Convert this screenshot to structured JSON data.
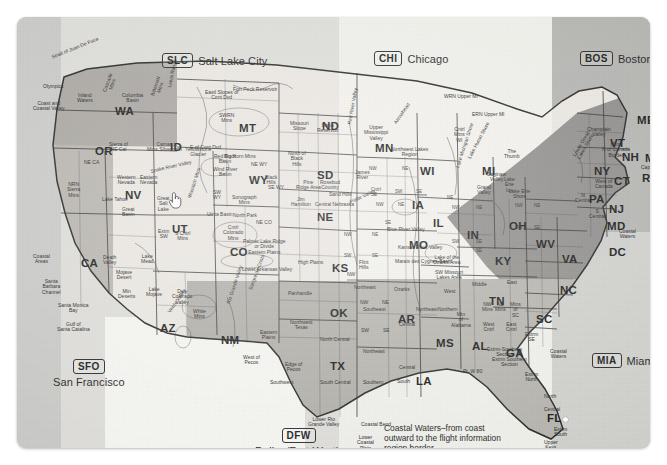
{
  "document": {
    "title": "United States Flight Information Region Map",
    "media": "scanned-paper-map"
  },
  "fir_callouts": [
    {
      "code": "SLC",
      "name": "Salt Lake City",
      "layout": "inline"
    },
    {
      "code": "CHI",
      "name": "Chicago",
      "layout": "inline"
    },
    {
      "code": "BOS",
      "name": "Boston",
      "layout": "inline"
    },
    {
      "code": "SFO",
      "name": "San Francisco",
      "layout": "stacked"
    },
    {
      "code": "DFW",
      "name": "Dallas/Fort Worth",
      "layout": "stacked"
    },
    {
      "code": "MIA",
      "name": "Miami",
      "layout": "inline"
    }
  ],
  "caption": {
    "coastal_waters": "Coastal Waters–from coast outward to the flight information region border"
  },
  "states": [
    {
      "abbr": "WA",
      "x": 98,
      "y": 88
    },
    {
      "abbr": "OR",
      "x": 78,
      "y": 128
    },
    {
      "abbr": "CA",
      "x": 64,
      "y": 240
    },
    {
      "abbr": "NV",
      "x": 108,
      "y": 172
    },
    {
      "abbr": "ID",
      "x": 153,
      "y": 124
    },
    {
      "abbr": "MT",
      "x": 222,
      "y": 105
    },
    {
      "abbr": "WY",
      "x": 232,
      "y": 157
    },
    {
      "abbr": "UT",
      "x": 155,
      "y": 206
    },
    {
      "abbr": "CO",
      "x": 213,
      "y": 229
    },
    {
      "abbr": "AZ",
      "x": 143,
      "y": 305
    },
    {
      "abbr": "NM",
      "x": 204,
      "y": 317
    },
    {
      "abbr": "ND",
      "x": 305,
      "y": 103
    },
    {
      "abbr": "SD",
      "x": 300,
      "y": 152
    },
    {
      "abbr": "NE",
      "x": 300,
      "y": 194
    },
    {
      "abbr": "KS",
      "x": 315,
      "y": 245
    },
    {
      "abbr": "OK",
      "x": 313,
      "y": 290
    },
    {
      "abbr": "TX",
      "x": 313,
      "y": 343
    },
    {
      "abbr": "MN",
      "x": 358,
      "y": 125
    },
    {
      "abbr": "IA",
      "x": 395,
      "y": 182
    },
    {
      "abbr": "MO",
      "x": 392,
      "y": 222
    },
    {
      "abbr": "AR",
      "x": 381,
      "y": 296
    },
    {
      "abbr": "LA",
      "x": 399,
      "y": 358
    },
    {
      "abbr": "WI",
      "x": 403,
      "y": 148
    },
    {
      "abbr": "IL",
      "x": 416,
      "y": 200
    },
    {
      "abbr": "MS",
      "x": 419,
      "y": 320
    },
    {
      "abbr": "MI",
      "x": 465,
      "y": 148
    },
    {
      "abbr": "IN",
      "x": 450,
      "y": 212
    },
    {
      "abbr": "OH",
      "x": 492,
      "y": 203
    },
    {
      "abbr": "KY",
      "x": 478,
      "y": 238
    },
    {
      "abbr": "TN",
      "x": 472,
      "y": 278
    },
    {
      "abbr": "AL",
      "x": 455,
      "y": 323
    },
    {
      "abbr": "GA",
      "x": 489,
      "y": 330
    },
    {
      "abbr": "FL",
      "x": 530,
      "y": 395
    },
    {
      "abbr": "SC",
      "x": 519,
      "y": 296
    },
    {
      "abbr": "NC",
      "x": 543,
      "y": 267
    },
    {
      "abbr": "VA",
      "x": 545,
      "y": 236
    },
    {
      "abbr": "WV",
      "x": 519,
      "y": 221
    },
    {
      "abbr": "PA",
      "x": 572,
      "y": 176
    },
    {
      "abbr": "NY",
      "x": 577,
      "y": 148
    },
    {
      "abbr": "VT",
      "x": 593,
      "y": 120
    },
    {
      "abbr": "NH",
      "x": 605,
      "y": 134
    },
    {
      "abbr": "ME",
      "x": 620,
      "y": 97
    },
    {
      "abbr": "MA",
      "x": 628,
      "y": 135
    },
    {
      "abbr": "CT",
      "x": 597,
      "y": 158
    },
    {
      "abbr": "RI",
      "x": 625,
      "y": 155
    },
    {
      "abbr": "NJ",
      "x": 592,
      "y": 186
    },
    {
      "abbr": "MD",
      "x": 590,
      "y": 203
    },
    {
      "abbr": "DC",
      "x": 592,
      "y": 229
    }
  ],
  "named_regions": [
    {
      "text": "Strait of Juan De Fuca",
      "x": 34,
      "y": 38,
      "rot": -22
    },
    {
      "text": "Olympics",
      "x": 26,
      "y": 67,
      "rot": 0
    },
    {
      "text": "Coast and\nCoastal Valley",
      "x": 16,
      "y": 84,
      "rot": 0
    },
    {
      "text": "Inland\nWaters",
      "x": 60,
      "y": 76,
      "rot": 0
    },
    {
      "text": "Cascade\nMtns",
      "x": 85,
      "y": 74,
      "rot": -70
    },
    {
      "text": "Columbia\nBasin",
      "x": 105,
      "y": 76,
      "rot": 0
    },
    {
      "text": "Bitterroot\nMtns",
      "x": 133,
      "y": 78,
      "rot": -72
    },
    {
      "text": "Lewis Range",
      "x": 150,
      "y": 70,
      "rot": -78
    },
    {
      "text": "E of Cont Dvd",
      "x": 173,
      "y": 128,
      "rot": 0
    },
    {
      "text": "Eastl Slopes of\nCont Dvd",
      "x": 188,
      "y": 73,
      "rot": 0
    },
    {
      "text": "Fort Peck Reservoir",
      "x": 216,
      "y": 70,
      "rot": 0
    },
    {
      "text": "SWRN\nMtns",
      "x": 202,
      "y": 96,
      "rot": 0
    },
    {
      "text": "Sierra of\nNE Cal",
      "x": 92,
      "y": 125,
      "rot": 0
    },
    {
      "text": "Snake River Valley",
      "x": 133,
      "y": 152,
      "rot": -13
    },
    {
      "text": "Camas\nMtns Silverhorn",
      "x": 130,
      "y": 125,
      "rot": 0
    },
    {
      "text": "Yellowstone\nGlacier",
      "x": 168,
      "y": 130,
      "rot": 0
    },
    {
      "text": "Big Horn Mtns",
      "x": 207,
      "y": 137,
      "rot": 0
    },
    {
      "text": "Wind River\nBasin",
      "x": 196,
      "y": 150,
      "rot": 0
    },
    {
      "text": "Red Rock\nBasin",
      "x": 197,
      "y": 137,
      "rot": 0
    },
    {
      "text": "Black\nHills",
      "x": 248,
      "y": 158,
      "rot": 0
    },
    {
      "text": "NE WY",
      "x": 234,
      "y": 145,
      "rot": 0
    },
    {
      "text": "SE WY",
      "x": 251,
      "y": 168,
      "rot": 0
    },
    {
      "text": "SW\nWY",
      "x": 196,
      "y": 173,
      "rot": 0
    },
    {
      "text": "Sonograph\nMtns",
      "x": 215,
      "y": 178,
      "rot": 0
    },
    {
      "text": "Great\nSalt\nLake",
      "x": 140,
      "y": 179,
      "rot": 0
    },
    {
      "text": "Wasatch Mtns",
      "x": 170,
      "y": 180,
      "rot": -72
    },
    {
      "text": "Uinta Basin",
      "x": 190,
      "y": 195,
      "rot": 0
    },
    {
      "text": "North Park",
      "x": 216,
      "y": 196,
      "rot": 0
    },
    {
      "text": "Western\nNevada",
      "x": 100,
      "y": 158,
      "rot": 0
    },
    {
      "text": "Eastern\nNevada",
      "x": 123,
      "y": 158,
      "rot": 0
    },
    {
      "text": "Lake Tahoe",
      "x": 85,
      "y": 180,
      "rot": 0
    },
    {
      "text": "Great\nBasin",
      "x": 105,
      "y": 190,
      "rot": 0
    },
    {
      "text": "NRN\nSierra\nMtns",
      "x": 50,
      "y": 165,
      "rot": 0
    },
    {
      "text": "NE CA",
      "x": 67,
      "y": 143,
      "rot": 0
    },
    {
      "text": "Extm\nSW",
      "x": 141,
      "y": 212,
      "rot": 0
    },
    {
      "text": "S Cntrl\nMtns",
      "x": 158,
      "y": 214,
      "rot": 0
    },
    {
      "text": "Cntrl\nColorado\nMtns",
      "x": 206,
      "y": 208,
      "rot": 0
    },
    {
      "text": "NE CO",
      "x": 239,
      "y": 203,
      "rot": 0
    },
    {
      "text": "Palmer Lake Ridge\nor Divide\nEastern Plains",
      "x": 226,
      "y": 222,
      "rot": 0
    },
    {
      "text": "Lower Arkansas Valley",
      "x": 225,
      "y": 250,
      "rot": 0
    },
    {
      "text": "High Plains",
      "x": 281,
      "y": 243,
      "rot": 0
    },
    {
      "text": "Coastal\nAreas",
      "x": 16,
      "y": 237,
      "rot": 0
    },
    {
      "text": "Santa\nBarbara\nChannel",
      "x": 25,
      "y": 262,
      "rot": 0
    },
    {
      "text": "Santa Monica\nBay",
      "x": 41,
      "y": 286,
      "rot": 0
    },
    {
      "text": "Gulf of\nSanta Catalina",
      "x": 40,
      "y": 305,
      "rot": 0
    },
    {
      "text": "Death\nValley",
      "x": 86,
      "y": 238,
      "rot": 0
    },
    {
      "text": "Mojave\nDesert",
      "x": 99,
      "y": 253,
      "rot": 0
    },
    {
      "text": "Mtn\nDeserts",
      "x": 101,
      "y": 272,
      "rot": 0
    },
    {
      "text": "Lake\nMead",
      "x": 124,
      "y": 237,
      "rot": 0
    },
    {
      "text": "Lake\nMojave",
      "x": 129,
      "y": 270,
      "rot": 0
    },
    {
      "text": "Dely\nColorado\nValley",
      "x": 155,
      "y": 272,
      "rot": 0
    },
    {
      "text": "White\nMtns",
      "x": 176,
      "y": 292,
      "rot": 0
    },
    {
      "text": "Verde Valley",
      "x": 150,
      "y": 294,
      "rot": -55
    },
    {
      "text": "Rio Grande Valley",
      "x": 209,
      "y": 286,
      "rot": -72
    },
    {
      "text": "Sangre de Cristo",
      "x": 231,
      "y": 272,
      "rot": -70
    },
    {
      "text": "Eastern\nPlains",
      "x": 243,
      "y": 313,
      "rot": 0
    },
    {
      "text": "West of\nPecos",
      "x": 226,
      "y": 338,
      "rot": 0
    },
    {
      "text": "Edge of\nPecos",
      "x": 268,
      "y": 345,
      "rot": 0
    },
    {
      "text": "Panhandle",
      "x": 271,
      "y": 274,
      "rot": 0
    },
    {
      "text": "Northwest\nTexas",
      "x": 273,
      "y": 303,
      "rot": 0
    },
    {
      "text": "North Central",
      "x": 303,
      "y": 320,
      "rot": 0
    },
    {
      "text": "South Central",
      "x": 303,
      "y": 363,
      "rot": 0
    },
    {
      "text": "Southwest",
      "x": 253,
      "y": 363,
      "rot": 0
    },
    {
      "text": "Lower Rio\nGrande Valley",
      "x": 291,
      "y": 400,
      "rot": 0
    },
    {
      "text": "Coastal Bend",
      "x": 344,
      "y": 405,
      "rot": 0
    },
    {
      "text": "Lower\nCoastal\nPlain",
      "x": 340,
      "y": 418,
      "rot": 0
    },
    {
      "text": "Missouri\nSlope",
      "x": 273,
      "y": 104,
      "rot": 0
    },
    {
      "text": "Dana\nReservoir",
      "x": 300,
      "y": 106,
      "rot": 0
    },
    {
      "text": "North of\nBlack\nHills",
      "x": 271,
      "y": 134,
      "rot": 0
    },
    {
      "text": "Red River Valley",
      "x": 330,
      "y": 107,
      "rot": -80
    },
    {
      "text": "James\nRiver",
      "x": 338,
      "y": 153,
      "rot": 0
    },
    {
      "text": "Pine\nRidge Area",
      "x": 279,
      "y": 163,
      "rot": 0
    },
    {
      "text": "Rosebud\nCountry",
      "x": 303,
      "y": 163,
      "rot": 0
    },
    {
      "text": "Sand Hills",
      "x": 312,
      "y": 175,
      "rot": 0
    },
    {
      "text": "Jim\nHamilton",
      "x": 274,
      "y": 180,
      "rot": 0
    },
    {
      "text": "Central Nebraska",
      "x": 298,
      "y": 185,
      "rot": 0
    },
    {
      "text": "Platte Valley",
      "x": 332,
      "y": 183,
      "rot": -25
    },
    {
      "text": "Upper\nMississippi\nValley",
      "x": 347,
      "y": 108,
      "rot": 0
    },
    {
      "text": "Arrowhead",
      "x": 376,
      "y": 105,
      "rot": -55
    },
    {
      "text": "Northwest Lakes\nRegion",
      "x": 374,
      "y": 130,
      "rot": 0
    },
    {
      "text": "WRN Upper MI",
      "x": 427,
      "y": 77,
      "rot": 0
    },
    {
      "text": "ERN Upper MI",
      "x": 455,
      "y": 95,
      "rot": 0
    },
    {
      "text": "Cntrl\nMtns\nWI",
      "x": 437,
      "y": 110,
      "rot": 0
    },
    {
      "text": "Lake Huron Shore",
      "x": 450,
      "y": 140,
      "rot": -62
    },
    {
      "text": "The\nThumb",
      "x": 487,
      "y": 132,
      "rot": 0
    },
    {
      "text": "Lake Michigan Shore",
      "x": 438,
      "y": 150,
      "rot": -72
    },
    {
      "text": "Saginaw\nValley",
      "x": 470,
      "y": 155,
      "rot": 0
    },
    {
      "text": "Grand\nValley",
      "x": 460,
      "y": 168,
      "rot": 0
    },
    {
      "text": "Lake Erie\nShore",
      "x": 492,
      "y": 172,
      "rot": 0
    },
    {
      "text": "Lake\nErie\nIce",
      "x": 487,
      "y": 160,
      "rot": 0
    },
    {
      "text": "Lower Great\nLakes Shore",
      "x": 555,
      "y": 138,
      "rot": -60
    },
    {
      "text": "Champlain\nValley",
      "x": 570,
      "y": 110,
      "rot": 0
    },
    {
      "text": "Mtns\nN of Canada\nBorder",
      "x": 585,
      "y": 125,
      "rot": 0
    },
    {
      "text": "West of\nCanada",
      "x": 578,
      "y": 162,
      "rot": 0
    },
    {
      "text": "N\nCentral",
      "x": 558,
      "y": 176,
      "rot": 0
    },
    {
      "text": "S\nCentral",
      "x": 572,
      "y": 192,
      "rot": 0
    },
    {
      "text": "Cape Cod",
      "x": 624,
      "y": 148,
      "rot": 0
    },
    {
      "text": "Coastal\nWaters",
      "x": 602,
      "y": 212,
      "rot": 0
    },
    {
      "text": "Blue River Valley",
      "x": 370,
      "y": 210,
      "rot": 0
    },
    {
      "text": "Kansas River Valley",
      "x": 381,
      "y": 228,
      "rot": 0
    },
    {
      "text": "Marais des Cygnes Basin",
      "x": 378,
      "y": 242,
      "rot": 0
    },
    {
      "text": "Lake of the\nOzarks Area",
      "x": 416,
      "y": 238,
      "rot": 0
    },
    {
      "text": "SW Missouri\nLakes Area",
      "x": 418,
      "y": 253,
      "rot": 0
    },
    {
      "text": "Flint\nHills",
      "x": 342,
      "y": 243,
      "rot": 0
    },
    {
      "text": "Ozarks",
      "x": 377,
      "y": 270,
      "rot": 0
    },
    {
      "text": "Northeast",
      "x": 337,
      "y": 268,
      "rot": 0
    },
    {
      "text": "Northeast",
      "x": 399,
      "y": 290,
      "rot": 0
    },
    {
      "text": "Southeast",
      "x": 346,
      "y": 290,
      "rot": 0
    },
    {
      "text": "Northeast",
      "x": 346,
      "y": 332,
      "rot": 0
    },
    {
      "text": "Central",
      "x": 382,
      "y": 305,
      "rot": 0
    },
    {
      "text": "Central",
      "x": 382,
      "y": 348,
      "rot": 0
    },
    {
      "text": "South",
      "x": 380,
      "y": 362,
      "rot": 0
    },
    {
      "text": "Southern",
      "x": 346,
      "y": 363,
      "rot": 0
    },
    {
      "text": "Northern",
      "x": 421,
      "y": 290,
      "rot": 0
    },
    {
      "text": "Middle",
      "x": 455,
      "y": 265,
      "rot": 0
    },
    {
      "text": "East",
      "x": 490,
      "y": 263,
      "rot": 0
    },
    {
      "text": "West",
      "x": 427,
      "y": 272,
      "rot": 0
    },
    {
      "text": "Pt. W 80",
      "x": 446,
      "y": 352,
      "rot": 0
    },
    {
      "text": "Extrm Southern\nSection",
      "x": 475,
      "y": 340,
      "rot": 0
    },
    {
      "text": "Extrm\nNorth",
      "x": 508,
      "y": 355,
      "rot": 0
    },
    {
      "text": "North",
      "x": 527,
      "y": 377,
      "rot": 0
    },
    {
      "text": "Central",
      "x": 527,
      "y": 390,
      "rot": 0
    },
    {
      "text": "Extrm\nSouth",
      "x": 537,
      "y": 410,
      "rot": 0
    },
    {
      "text": "Upper\nKeys",
      "x": 527,
      "y": 423,
      "rot": 0
    },
    {
      "text": "Lower Keys",
      "x": 497,
      "y": 437,
      "rot": 0
    },
    {
      "text": "Florida Straits",
      "x": 541,
      "y": 437,
      "rot": 0
    },
    {
      "text": "Coastal\nWaters",
      "x": 533,
      "y": 332,
      "rot": 0
    },
    {
      "text": "Extrm-Southern\nSection",
      "x": 470,
      "y": 330,
      "rot": 0
    },
    {
      "text": "Mtns\nof\nSC",
      "x": 493,
      "y": 285,
      "rot": 0
    },
    {
      "text": "NW\nMtns",
      "x": 465,
      "y": 285,
      "rot": 0
    },
    {
      "text": "NE\nMtns",
      "x": 478,
      "y": 285,
      "rot": 0
    },
    {
      "text": "West\nCntrl",
      "x": 466,
      "y": 305,
      "rot": 0
    },
    {
      "text": "East\nCntrl",
      "x": 489,
      "y": 305,
      "rot": 0
    },
    {
      "text": "Extrm\nSE",
      "x": 508,
      "y": 315,
      "rot": 0
    },
    {
      "text": "Mtn\nof\nAlabama",
      "x": 434,
      "y": 295,
      "rot": 0
    },
    {
      "text": "NW",
      "x": 343,
      "y": 283,
      "rot": 0
    },
    {
      "text": "NE",
      "x": 365,
      "y": 283,
      "rot": 0
    },
    {
      "text": "SW",
      "x": 344,
      "y": 311,
      "rot": 0
    },
    {
      "text": "SE",
      "x": 366,
      "y": 311,
      "rot": 0
    },
    {
      "text": "NW",
      "x": 330,
      "y": 255,
      "rot": 0
    }
  ],
  "zone_cells": [
    {
      "text": "NW",
      "x": 352,
      "y": 149
    },
    {
      "text": "NE",
      "x": 385,
      "y": 149
    },
    {
      "text": "Cntrl\nSE",
      "x": 354,
      "y": 170
    },
    {
      "text": "SW",
      "x": 378,
      "y": 172
    },
    {
      "text": "SE",
      "x": 399,
      "y": 172
    },
    {
      "text": "NW",
      "x": 359,
      "y": 185
    },
    {
      "text": "NE",
      "x": 381,
      "y": 185
    },
    {
      "text": "SE",
      "x": 368,
      "y": 203
    },
    {
      "text": "NW",
      "x": 435,
      "y": 188
    },
    {
      "text": "NE",
      "x": 459,
      "y": 188
    },
    {
      "text": "SW",
      "x": 435,
      "y": 222
    },
    {
      "text": "SE",
      "x": 459,
      "y": 222
    },
    {
      "text": "NW",
      "x": 327,
      "y": 215
    },
    {
      "text": "NE",
      "x": 355,
      "y": 215
    },
    {
      "text": "SW",
      "x": 327,
      "y": 236
    },
    {
      "text": "SE",
      "x": 355,
      "y": 236
    },
    {
      "text": "NW",
      "x": 498,
      "y": 186
    },
    {
      "text": "NE",
      "x": 517,
      "y": 186
    },
    {
      "text": "SW",
      "x": 498,
      "y": 208
    },
    {
      "text": "SE",
      "x": 517,
      "y": 208
    },
    {
      "text": "SE",
      "x": 459,
      "y": 231
    },
    {
      "text": "NE",
      "x": 430,
      "y": 178
    }
  ],
  "cursors": [
    {
      "type": "hand-pointer",
      "x": 151,
      "y": 174,
      "over": "UT"
    },
    {
      "type": "dot-marker",
      "x": 546,
      "y": 400,
      "over": "FL"
    }
  ],
  "colors": {
    "sheet_base": "#d6d6d4",
    "band_sfo": "#c9c9c6",
    "band_slc": "#dddcd8",
    "band_chi": "#eeeeea",
    "band_bos": "#b4b4b1",
    "band_mia": "#cfcfcc",
    "land_light": "#eceae4",
    "land_mid": "#cfcdc6",
    "land_dark": "#9a9a96",
    "outline": "#2b2b2b",
    "text": "#1c1c1c"
  }
}
